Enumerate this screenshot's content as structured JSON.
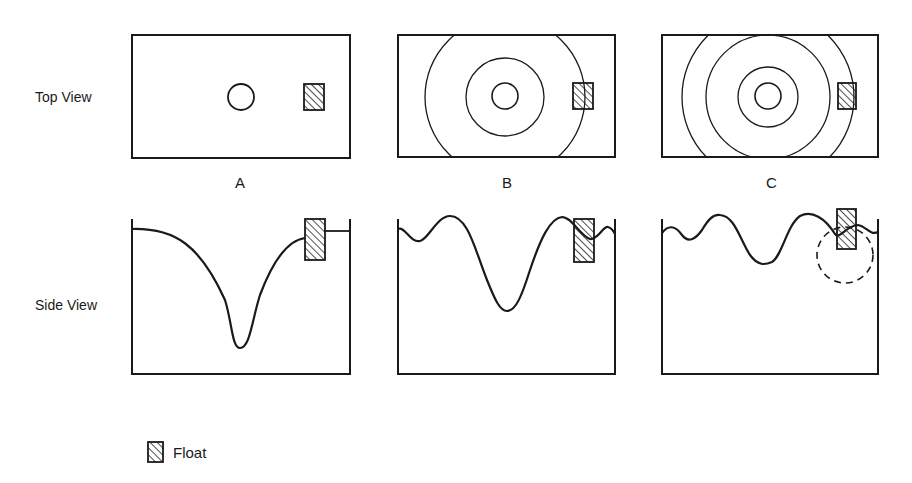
{
  "rows": {
    "top": {
      "label": "Top View"
    },
    "side": {
      "label": "Side View"
    }
  },
  "panels": [
    {
      "id": "A",
      "label": "A"
    },
    {
      "id": "B",
      "label": "B"
    },
    {
      "id": "C",
      "label": "C"
    }
  ],
  "legend": {
    "items": [
      {
        "symbol": "hatched-rectangle",
        "label": "Float"
      }
    ]
  }
}
